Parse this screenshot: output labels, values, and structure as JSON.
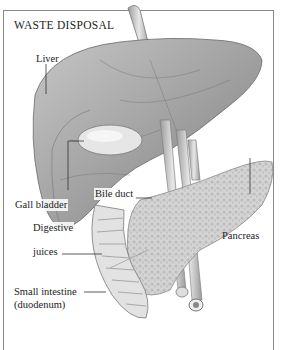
{
  "title": "WASTE DISPOSAL",
  "labels": {
    "liver": "Liver",
    "gall_bladder": "Gall bladder",
    "bile_duct": "Bile duct",
    "pancreas": "Pancreas",
    "digestive_juices_line1": "Digestive",
    "digestive_juices_line2": "juices",
    "small_intestine_line1": "Small intestine",
    "small_intestine_line2": "(duodenum)"
  },
  "colors": {
    "frame": "#8a8a8a",
    "liver_fill": "#a9a9a9",
    "liver_dark": "#8c8c8c",
    "pancreas_fill": "#d2d2d2",
    "vessel": "#b5b5b5",
    "text": "#222222"
  }
}
